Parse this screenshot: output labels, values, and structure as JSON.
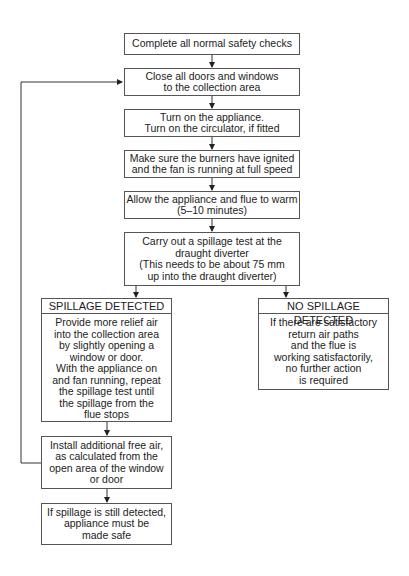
{
  "flowchart": {
    "steps": [
      {
        "id": "safety-checks",
        "lines": [
          "Complete all normal safety checks"
        ]
      },
      {
        "id": "close-doors",
        "lines": [
          "Close all doors and windows",
          "to the collection area"
        ]
      },
      {
        "id": "turn-on",
        "lines": [
          "Turn on the appliance.",
          "Turn on the circulator, if fitted"
        ]
      },
      {
        "id": "burners",
        "lines": [
          "Make sure the burners have ignited",
          "and the fan is running at full speed"
        ]
      },
      {
        "id": "warm",
        "lines": [
          "Allow the appliance and flue to warm",
          "(5–10 minutes)"
        ]
      },
      {
        "id": "spillage-test",
        "lines": [
          "Carry out a spillage test at the",
          "draught diverter",
          "(This needs to be about 75 mm",
          "up into the draught diverter)"
        ]
      }
    ],
    "spillage": {
      "header": "SPILLAGE DETECTED",
      "lines": [
        "Provide more relief air",
        "into the collection area",
        "by slightly opening a",
        "window or door.",
        "With the appliance on",
        "and fan running, repeat",
        "the spillage test until",
        "the spillage from the",
        "flue stops"
      ]
    },
    "no_spillage": {
      "header": "NO SPILLAGE DETECTED",
      "lines": [
        "If there are satisfactory",
        "return air paths",
        "and the flue is",
        "working satisfactorily,",
        "no further action",
        "is required"
      ]
    },
    "install_air": {
      "lines": [
        "Install additional free air,",
        "as calculated from the",
        "open area of the window",
        "or door"
      ]
    },
    "make_safe": {
      "lines": [
        "If spillage is still detected,",
        "appliance must be",
        "made safe"
      ]
    }
  }
}
